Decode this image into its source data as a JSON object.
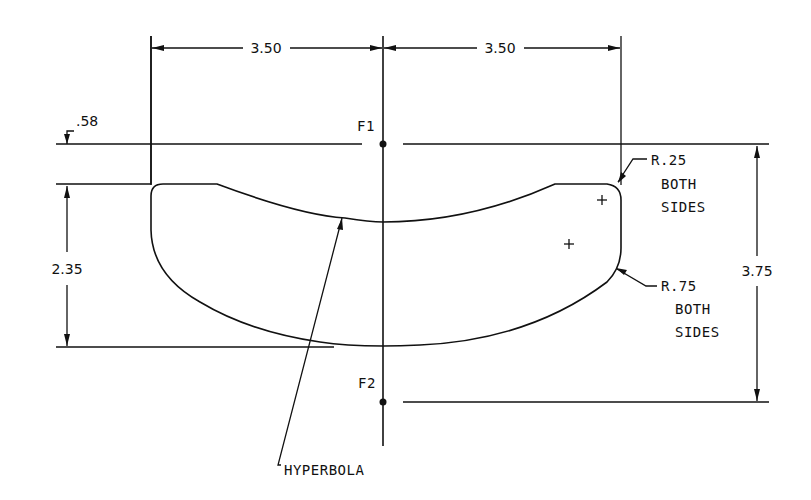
{
  "drawing": {
    "type": "technical-drawing",
    "dimensions": {
      "left_width": "3.50",
      "right_width": "3.50",
      "top_offset": ".58",
      "height_left": "2.35",
      "height_right": "3.75"
    },
    "labels": {
      "focus_1": "F1",
      "focus_2": "F2",
      "hyperbola": "HYPERBOLA",
      "radius_small": "R.25",
      "radius_small_note_1": "BOTH",
      "radius_small_note_2": "SIDES",
      "radius_large": "R.75",
      "radius_large_note_1": "BOTH",
      "radius_large_note_2": "SIDES"
    },
    "colors": {
      "line": "#111111",
      "background": "#ffffff"
    }
  }
}
